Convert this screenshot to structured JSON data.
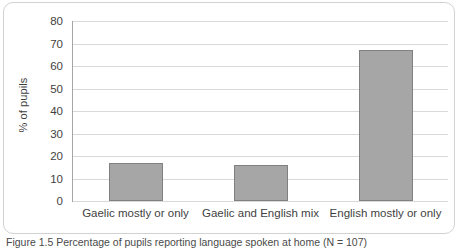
{
  "figure": {
    "caption": "Figure 1.5 Percentage of pupils reporting language spoken at home (N = 107)"
  },
  "chart_data": {
    "type": "bar",
    "title": "",
    "xlabel": "",
    "ylabel": "% of pupils",
    "categories": [
      "Gaelic mostly or only",
      "Gaelic and English mix",
      "English mostly or only"
    ],
    "values": [
      17,
      16,
      67
    ],
    "ylim": [
      0,
      80
    ],
    "yticks": [
      0,
      10,
      20,
      30,
      40,
      50,
      60,
      70,
      80
    ],
    "ytick_labels": [
      "0",
      "10",
      "20",
      "30",
      "40",
      "50",
      "60",
      "70",
      "80"
    ],
    "grid": true,
    "legend": "none",
    "bar_fill_color": "#a6a6a6",
    "bar_border_color": "#808080",
    "gridline_color": "#d9d9d9",
    "axis_color": "#a6a6a6",
    "text_color": "#3f3f3f",
    "border_color": "#d2d2d2"
  }
}
